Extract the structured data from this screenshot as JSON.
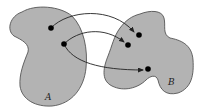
{
  "diagram": {
    "type": "set-relation",
    "colors": {
      "set_fill": "#b3b3b3",
      "set_stroke": "#555555",
      "arrow": "#222222",
      "point": "#000000",
      "background": "#ffffff"
    },
    "sets": [
      {
        "id": "A",
        "label": "A"
      },
      {
        "id": "B",
        "label": "B"
      }
    ],
    "points": [
      {
        "id": "a1",
        "set": "A"
      },
      {
        "id": "a2",
        "set": "A"
      },
      {
        "id": "b1",
        "set": "B"
      },
      {
        "id": "b2",
        "set": "B"
      },
      {
        "id": "b3",
        "set": "B"
      }
    ],
    "arrows": [
      {
        "from": "a1",
        "to": "b1"
      },
      {
        "from": "a2",
        "to": "b2"
      },
      {
        "from": "a2",
        "to": "b3"
      }
    ]
  }
}
